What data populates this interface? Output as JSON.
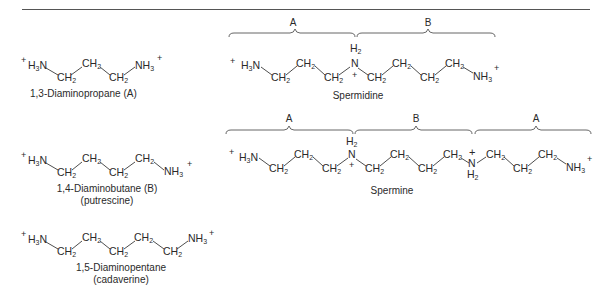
{
  "figure": {
    "compounds": [
      {
        "id": "diaminopropane",
        "name": "1,3-Diaminopropane (A)",
        "chain": [
          "+H3N",
          "CH2",
          "CH2",
          "CH2",
          "NH3+"
        ]
      },
      {
        "id": "diaminobutane",
        "name": "1,4-Diaminobutane (B)",
        "alt_name": "(putrescine)",
        "chain": [
          "+H3N",
          "CH2",
          "CH2",
          "CH2",
          "CH2",
          "NH3+"
        ]
      },
      {
        "id": "diaminopentane",
        "name": "1,5-Diaminopentane",
        "alt_name": "(cadaverine)",
        "chain": [
          "+H3N",
          "CH2",
          "CH2",
          "CH2",
          "CH2",
          "CH2",
          "NH3+"
        ]
      },
      {
        "id": "spermidine",
        "name": "Spermidine",
        "segments": [
          "A",
          "B"
        ],
        "chain": [
          "+H3N",
          "CH2",
          "CH2",
          "CH2",
          "N+H2",
          "CH2",
          "CH2",
          "CH2",
          "CH2",
          "NH3+"
        ]
      },
      {
        "id": "spermine",
        "name": "Spermine",
        "segments": [
          "A",
          "B",
          "A"
        ],
        "chain": [
          "+H3N",
          "CH2",
          "CH2",
          "CH2",
          "N+H2",
          "CH2",
          "CH2",
          "CH2",
          "CH2",
          "N+H2",
          "CH2",
          "CH2",
          "CH2",
          "NH3+"
        ]
      }
    ],
    "labels": {
      "seg_a": "A",
      "seg_b": "B",
      "plus": "+",
      "h3n": "H",
      "h3n_sub": "3",
      "h3n_n": "N",
      "ch": "CH",
      "sub2": "2",
      "nh": "NH",
      "sub3": "3",
      "n": "N",
      "h": "H"
    }
  }
}
